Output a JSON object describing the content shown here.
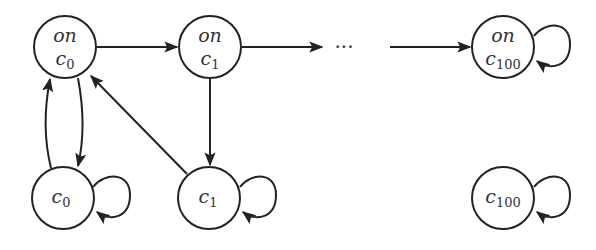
{
  "diagram": {
    "type": "state-transition-graph",
    "nodes": [
      {
        "id": "on_c0",
        "line1": "on",
        "base": "c",
        "sub": "0",
        "x": 65,
        "y": 47
      },
      {
        "id": "on_c1",
        "line1": "on",
        "base": "c",
        "sub": "1",
        "x": 210,
        "y": 47
      },
      {
        "id": "on_c100",
        "line1": "on",
        "base": "c",
        "sub": "100",
        "x": 503,
        "y": 47
      },
      {
        "id": "c0",
        "line1": "",
        "base": "c",
        "sub": "0",
        "x": 63,
        "y": 198
      },
      {
        "id": "c1",
        "line1": "",
        "base": "c",
        "sub": "1",
        "x": 209,
        "y": 198
      },
      {
        "id": "c100",
        "line1": "",
        "base": "c",
        "sub": "100",
        "x": 503,
        "y": 198
      }
    ],
    "edges": [
      {
        "from": "on_c0",
        "to": "on_c1"
      },
      {
        "from": "on_c1",
        "to": "ellipsis"
      },
      {
        "from": "ellipsis",
        "to": "on_c100"
      },
      {
        "from": "on_c0",
        "to": "c0"
      },
      {
        "from": "c0",
        "to": "on_c0"
      },
      {
        "from": "on_c1",
        "to": "c1"
      },
      {
        "from": "c1",
        "to": "on_c0"
      },
      {
        "from": "c0",
        "to": "c0",
        "self_loop": true
      },
      {
        "from": "c1",
        "to": "c1",
        "self_loop": true
      },
      {
        "from": "c100",
        "to": "c100",
        "self_loop": true
      },
      {
        "from": "on_c100",
        "to": "on_c100",
        "self_loop": true
      }
    ],
    "ellipsis": "···"
  }
}
